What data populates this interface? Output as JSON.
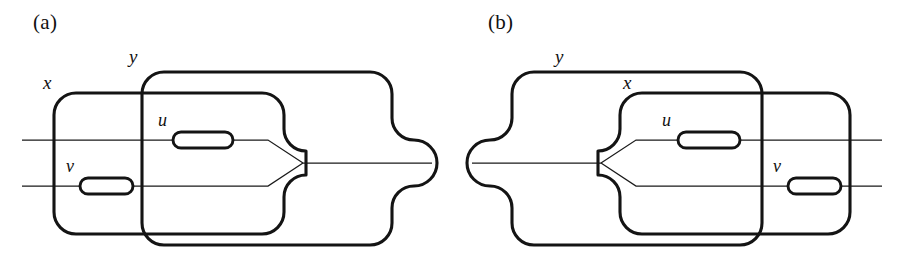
{
  "figure": {
    "type": "topological-diagram",
    "background_color": "#ffffff",
    "line_color": "#141414",
    "thin_line_color": "#1a1a1a"
  },
  "panels": [
    {
      "id": "a",
      "label": "(a)",
      "label_x": 33,
      "label_y": 21,
      "regions": [
        {
          "name": "x",
          "label": "x",
          "label_x": 43,
          "label_y": 83,
          "role": "inner-left-region"
        },
        {
          "name": "y",
          "label": "y",
          "label_x": 129,
          "label_y": 57,
          "role": "outer-right-region"
        }
      ],
      "nodes": [
        {
          "name": "u",
          "label": "u",
          "label_x": 158,
          "label_y": 121,
          "capsule_x": 173,
          "capsule_y": 132,
          "capsule_w": 60,
          "capsule_h": 16
        },
        {
          "name": "v",
          "label": "v",
          "label_x": 66,
          "label_y": 167,
          "capsule_x": 80,
          "capsule_y": 178,
          "capsule_w": 53,
          "capsule_h": 16
        }
      ],
      "arcs": [
        {
          "name": "upper-arc",
          "y": 140
        },
        {
          "name": "lower-arc",
          "y": 186
        },
        {
          "name": "merged-arc",
          "y": 163
        }
      ],
      "fork_vertex": {
        "x": 303,
        "y": 163
      },
      "orientation": "left-to-right"
    },
    {
      "id": "b",
      "label": "(b)",
      "label_x": 488,
      "label_y": 21,
      "regions": [
        {
          "name": "y",
          "label": "y",
          "label_x": 555,
          "label_y": 57,
          "role": "outer-left-region"
        },
        {
          "name": "x",
          "label": "x",
          "label_x": 623,
          "label_y": 83,
          "role": "inner-right-region"
        }
      ],
      "nodes": [
        {
          "name": "u",
          "label": "u",
          "label_x": 662,
          "label_y": 121,
          "capsule_x": 678,
          "capsule_y": 132,
          "capsule_w": 62,
          "capsule_h": 16
        },
        {
          "name": "v",
          "label": "v",
          "label_x": 773,
          "label_y": 167,
          "capsule_x": 788,
          "capsule_y": 178,
          "capsule_w": 53,
          "capsule_h": 16
        }
      ],
      "arcs": [
        {
          "name": "upper-arc",
          "y": 140
        },
        {
          "name": "lower-arc",
          "y": 186
        },
        {
          "name": "merged-arc",
          "y": 163
        }
      ],
      "fork_vertex": {
        "x": 601,
        "y": 163
      },
      "orientation": "right-to-left"
    }
  ]
}
